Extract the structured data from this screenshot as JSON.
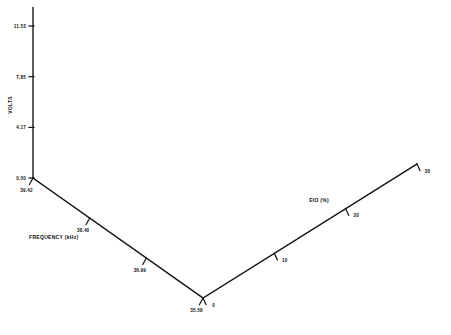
{
  "figure": {
    "kind": "3d-wireframe-surface-plot",
    "background_color": "#ffffff",
    "line_color": "#1b1b1b",
    "axis_color": "#101010",
    "scan_quality": "low-resolution facsimile"
  },
  "chart_data": {
    "type": "line",
    "render_as": "3d-wireframe-surface",
    "title": "",
    "subtitle": "",
    "xlabel": "FREQUENCY (kHz)",
    "ylabel": "EIO (%)",
    "zlabel": "VOLTS",
    "grid": false,
    "legend": "none",
    "legend_entries": [],
    "annotations": [],
    "x_axis": {
      "name": "FREQUENCY (kHz)",
      "unit": "kHz",
      "tick_labels": [
        "39.42",
        "38.40",
        "36.99",
        "35.58"
      ],
      "tick_values": [
        39.42,
        38.4,
        36.99,
        35.58
      ],
      "range": [
        35.58,
        39.42
      ],
      "direction": "decreasing-toward-viewer"
    },
    "y_axis": {
      "name": "EIO (%)",
      "unit": "%",
      "tick_labels": [
        "0",
        "10",
        "20",
        "30"
      ],
      "tick_values": [
        0,
        10,
        20,
        30
      ],
      "range": [
        0,
        30
      ],
      "direction": "increasing-to-the-right"
    },
    "z_axis": {
      "name": "VOLTS",
      "unit": "V",
      "tick_labels": [
        "0.50",
        "4.17",
        "7.85",
        "11.53"
      ],
      "tick_values": [
        0.5,
        4.17,
        7.85,
        11.53
      ],
      "range": [
        0.5,
        11.53
      ]
    },
    "surface_model": {
      "description": "Periodic two-dimensional standing-wave interference pattern; voltage is high along the back and side edges and dips into a deep valley near the front-left corner.",
      "grid_rows": 44,
      "grid_cols": 44,
      "amplitude_volts": 11.53,
      "baseline_volts": 0.5,
      "ripple_count_x": 4.25,
      "ripple_count_y": 4.25,
      "corner_peak_volts": 11.53,
      "valley_floor_volts": 0.5
    }
  },
  "projection": {
    "origin_x": 203,
    "origin_y": 298,
    "x_axis_vector": [
      -170,
      -120
    ],
    "y_axis_vector": [
      214,
      -134
    ],
    "z_axis_height": 152
  },
  "labels": {
    "z_title": "VOLTS",
    "x_title": "FREQUENCY (kHz)",
    "y_title": "EIO (%)",
    "z_ticks": [
      "11.53",
      "7.85",
      "4.17",
      "0.50"
    ],
    "x_ticks": [
      "39.42",
      "38.40",
      "36.99",
      "35.58"
    ],
    "y_ticks": [
      "0",
      "10",
      "20",
      "30"
    ]
  }
}
